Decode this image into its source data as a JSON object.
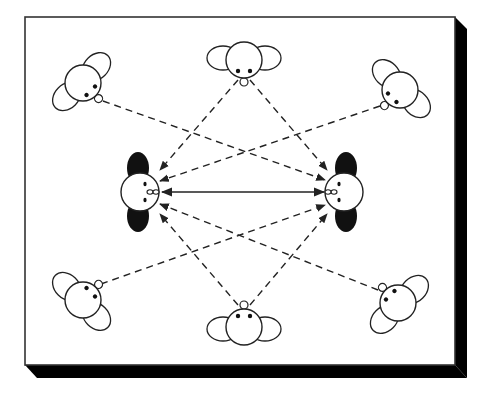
{
  "diagram": {
    "type": "seating-layout",
    "colors": {
      "line": "#222222",
      "shadow": "#000000",
      "background": "#ffffff",
      "dark_hair": "#111111"
    },
    "frame": {
      "x": 25,
      "y": 17,
      "width": 430,
      "height": 348,
      "shadow_depth": 12
    },
    "central_people": [
      {
        "id": "center-left",
        "cx": 140,
        "cy": 192,
        "facing": "right"
      },
      {
        "id": "center-right",
        "cx": 344,
        "cy": 192,
        "facing": "left"
      }
    ],
    "outer_people": [
      {
        "id": "top-left",
        "cx": 83,
        "cy": 83,
        "rotation": -45,
        "nose": [
          97,
          98
        ]
      },
      {
        "id": "top-middle",
        "cx": 244,
        "cy": 60,
        "rotation": 0,
        "nose": [
          244,
          82
        ]
      },
      {
        "id": "top-right",
        "cx": 400,
        "cy": 90,
        "rotation": 45,
        "nose": [
          384,
          104
        ]
      },
      {
        "id": "bottom-left",
        "cx": 83,
        "cy": 300,
        "rotation": -135,
        "nose": [
          96,
          284
        ]
      },
      {
        "id": "bottom-middle",
        "cx": 244,
        "cy": 327,
        "rotation": 180,
        "nose": [
          244,
          305
        ]
      },
      {
        "id": "bottom-right",
        "cx": 398,
        "cy": 303,
        "rotation": 135,
        "nose": [
          383,
          289
        ]
      }
    ],
    "gaze_lines": [
      {
        "from": "top-left",
        "to": "center-right",
        "x1": 103,
        "y1": 101,
        "x2": 325,
        "y2": 180
      },
      {
        "from": "top-middle",
        "to": "center-left",
        "x1": 238,
        "y1": 80,
        "x2": 160,
        "y2": 170
      },
      {
        "from": "top-middle",
        "to": "center-right",
        "x1": 250,
        "y1": 80,
        "x2": 327,
        "y2": 170
      },
      {
        "from": "top-right",
        "to": "center-left",
        "x1": 380,
        "y1": 106,
        "x2": 160,
        "y2": 181
      },
      {
        "from": "bottom-left",
        "to": "center-right",
        "x1": 101,
        "y1": 284,
        "x2": 325,
        "y2": 205
      },
      {
        "from": "bottom-middle",
        "to": "center-left",
        "x1": 238,
        "y1": 305,
        "x2": 160,
        "y2": 214
      },
      {
        "from": "bottom-middle",
        "to": "center-right",
        "x1": 250,
        "y1": 305,
        "x2": 327,
        "y2": 214
      },
      {
        "from": "bottom-right",
        "to": "center-left",
        "x1": 378,
        "y1": 290,
        "x2": 160,
        "y2": 204
      }
    ],
    "mutual_gaze": {
      "from": "center-left",
      "to": "center-right",
      "x1": 162,
      "y1": 192,
      "x2": 324,
      "y2": 192,
      "style": "solid",
      "double_headed": true
    }
  }
}
